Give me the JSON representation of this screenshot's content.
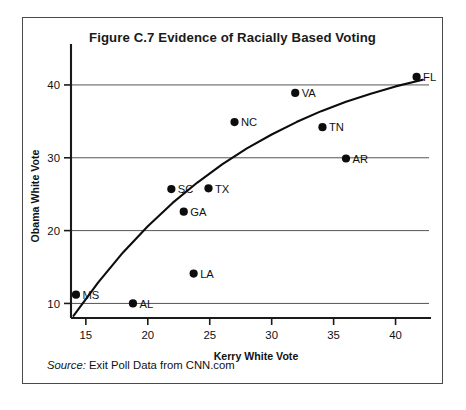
{
  "figure": {
    "title": "Figure C.7  Evidence of Racially Based Voting",
    "source_label": "Source:",
    "source_text": " Exit Poll Data from CNN.com"
  },
  "chart_data": {
    "type": "scatter",
    "title": "Figure C.7  Evidence of Racially Based Voting",
    "xlabel": "Kerry White Vote",
    "ylabel": "Obama White Vote",
    "xlim": [
      13.8,
      42.7
    ],
    "ylim": [
      8.0,
      42.6
    ],
    "xticks": [
      15,
      20,
      25,
      30,
      35,
      40
    ],
    "yticks": [
      10,
      20,
      30,
      40
    ],
    "grid": "horizontal",
    "legend": "none",
    "points": [
      {
        "label": "MS",
        "x": 14.2,
        "y": 11.2
      },
      {
        "label": "AL",
        "x": 18.8,
        "y": 10.0
      },
      {
        "label": "SC",
        "x": 21.9,
        "y": 25.7
      },
      {
        "label": "GA",
        "x": 22.9,
        "y": 22.6
      },
      {
        "label": "LA",
        "x": 23.7,
        "y": 14.1
      },
      {
        "label": "TX",
        "x": 24.9,
        "y": 25.8
      },
      {
        "label": "NC",
        "x": 27.0,
        "y": 34.9
      },
      {
        "label": "VA",
        "x": 31.9,
        "y": 38.9
      },
      {
        "label": "TN",
        "x": 34.1,
        "y": 34.2
      },
      {
        "label": "AR",
        "x": 36.0,
        "y": 29.9
      },
      {
        "label": "FL",
        "x": 41.7,
        "y": 41.1
      }
    ],
    "trend_line": {
      "description": "fitted concave curve",
      "x": [
        14.0,
        16.0,
        18.0,
        20.0,
        22.0,
        24.0,
        26.0,
        28.0,
        30.0,
        32.0,
        34.0,
        36.0,
        38.0,
        40.0,
        42.2
      ],
      "y": [
        8.3,
        12.9,
        17.0,
        20.6,
        23.8,
        26.6,
        29.1,
        31.3,
        33.2,
        34.9,
        36.4,
        37.7,
        38.8,
        39.8,
        40.7
      ]
    },
    "colors": {
      "point": "#0d0d0d",
      "curve": "#0d0d0d",
      "grid": "#555555",
      "axis": "#1a1a1a",
      "frame": "#4a4a4a",
      "background": "#ffffff"
    }
  }
}
